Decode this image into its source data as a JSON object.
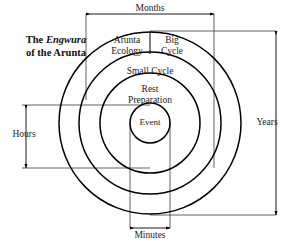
{
  "figure": {
    "type": "concentric-circles-diagram",
    "title_line1_prefix": "The ",
    "title_line1_italic": "Engwura",
    "title_line2": "of the Arunta",
    "background_color": "#ffffff",
    "stroke_color": "#000000",
    "text_color": "#1a1a1a"
  },
  "rings": [
    {
      "id": "outer",
      "radius": 91,
      "labels": [
        "Arunta Ecology",
        "Big Cycle"
      ],
      "label_left": "Arunta\nEcology",
      "label_right": "Big\nCycle",
      "label_left_line1": "Arunta",
      "label_left_line2": "Ecology",
      "label_right_line1": "Big",
      "label_right_line2": "Cycle",
      "timescale": "Years"
    },
    {
      "id": "second",
      "radius": 71,
      "label": "Small Cycle",
      "timescale": "Months"
    },
    {
      "id": "third",
      "radius": 50,
      "label_line1": "Rest",
      "label_line2": "Preparation",
      "timescale": "Hours"
    },
    {
      "id": "inner",
      "radius": 20,
      "label": "Event",
      "timescale": "Minutes"
    }
  ],
  "dimensions": {
    "months": {
      "label": "Months",
      "orientation": "horizontal",
      "position": "top"
    },
    "years": {
      "label": "Years",
      "orientation": "vertical",
      "position": "right"
    },
    "hours": {
      "label": "Hours",
      "orientation": "vertical",
      "position": "left"
    },
    "minutes": {
      "label": "Minutes",
      "orientation": "horizontal",
      "position": "bottom"
    }
  },
  "center": {
    "x": 150,
    "y": 123
  }
}
